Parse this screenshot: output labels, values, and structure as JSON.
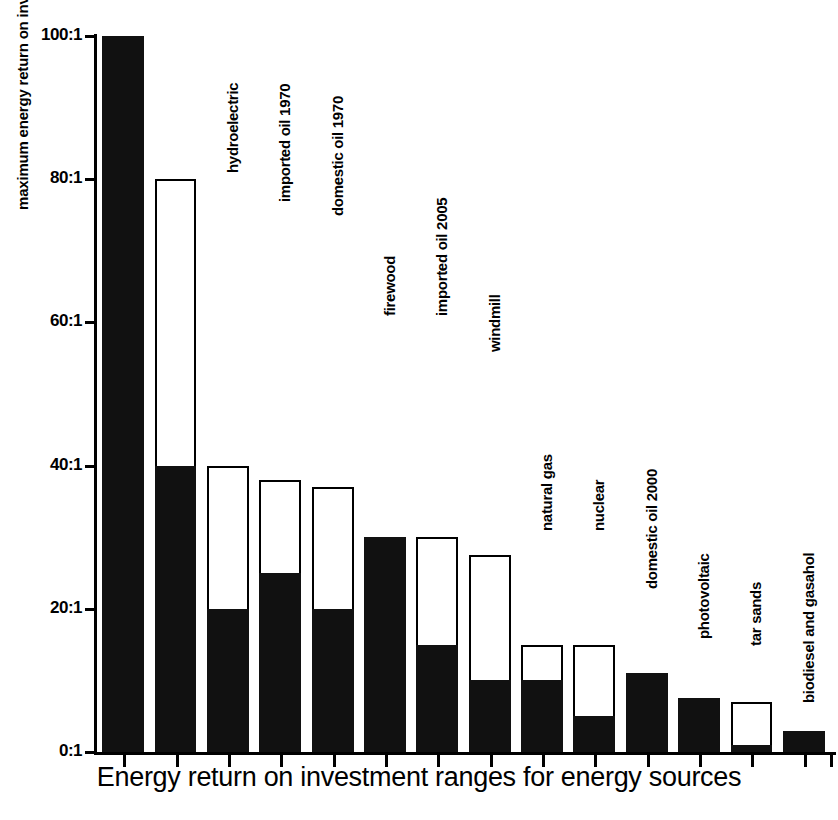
{
  "chart_data": {
    "type": "bar",
    "title": "Energy return on investment ranges for energy sources",
    "xlabel": "",
    "ylabel": "maximum energy return on investment",
    "ylim": [
      0,
      100
    ],
    "ytick_values": [
      0,
      20,
      40,
      60,
      80,
      100
    ],
    "ytick_labels": [
      "0:1",
      "20:1",
      "40:1",
      "60:1",
      "80:1",
      "100:1"
    ],
    "grid": false,
    "legend": null,
    "note": "Floating/stacked range bars: each category shows a low value (filled black) and a high value (open/white top). Where low equals high the bar is solid black.",
    "categories": [
      "coal 1950",
      "coal 2005",
      "hydroelectric",
      "imported oil 1970",
      "domestic oil 1970",
      "firewood",
      "imported oil 2005",
      "windmill",
      "natural gas",
      "nuclear",
      "domestic oil 2000",
      "photovoltaic",
      "tar sands",
      "biodiesel and gasahol"
    ],
    "labels_shown": [
      "",
      "coal 2005",
      "hydroelectric",
      "imported oil 1970",
      "domestic oil 1970",
      "firewood",
      "imported oil 2005",
      "windmill",
      "natural gas",
      "nuclear",
      "domestic oil 2000",
      "photovoltaic",
      "tar sands",
      "biodiesel and gasahol"
    ],
    "series": [
      {
        "name": "low (minimum EROI)",
        "values": [
          100,
          40,
          20,
          25,
          20,
          30,
          15,
          10,
          10,
          5,
          11,
          7.5,
          1,
          3
        ]
      },
      {
        "name": "high (maximum EROI)",
        "values": [
          100,
          80,
          40,
          38,
          37,
          30,
          30,
          27.5,
          15,
          15,
          11,
          7.5,
          7,
          3
        ]
      }
    ],
    "bars": [
      {
        "label": "",
        "low": 100,
        "high": 100
      },
      {
        "label": "coal 2005",
        "low": 40,
        "high": 80
      },
      {
        "label": "hydroelectric",
        "low": 20,
        "high": 40
      },
      {
        "label": "imported oil 1970",
        "low": 25,
        "high": 38
      },
      {
        "label": "domestic oil 1970",
        "low": 20,
        "high": 37
      },
      {
        "label": "firewood",
        "low": 30,
        "high": 30
      },
      {
        "label": "imported oil 2005",
        "low": 15,
        "high": 30
      },
      {
        "label": "windmill",
        "low": 10,
        "high": 27.5
      },
      {
        "label": "natural gas",
        "low": 10,
        "high": 15
      },
      {
        "label": "nuclear",
        "low": 5,
        "high": 15
      },
      {
        "label": "domestic oil 2000",
        "low": 11,
        "high": 11
      },
      {
        "label": "photovoltaic",
        "low": 7.5,
        "high": 7.5
      },
      {
        "label": "tar sands",
        "low": 1,
        "high": 7
      },
      {
        "label": "biodiesel and gasahol",
        "low": 3,
        "high": 3
      }
    ],
    "colors": {
      "low_fill": "#111111",
      "high_fill": "#ffffff",
      "outline": "#000000",
      "background": "#ffffff"
    }
  }
}
